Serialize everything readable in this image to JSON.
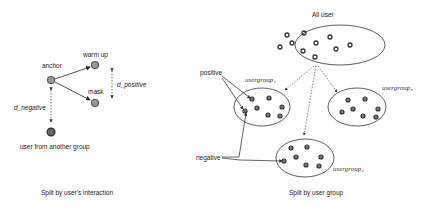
{
  "left_panel": {
    "caption": "Split by user's interaction",
    "nodes": {
      "anchor": "anchor",
      "warm_up": "warm up",
      "mask": "mask",
      "other": "user from another group"
    },
    "distances": {
      "positive": "d_positive",
      "negative": "d_negative"
    },
    "colors": {
      "node_fill": "#8a8a8a",
      "node_stroke": "#444444"
    }
  },
  "right_panel": {
    "caption": "Split by user group",
    "all_user_label": "All user",
    "groups": [
      {
        "label": "usergroup₁"
      },
      {
        "label": "usergroup₂"
      },
      {
        "label": "usergroup₃"
      }
    ],
    "labels": {
      "positive": "positive",
      "negative": "negative"
    }
  }
}
